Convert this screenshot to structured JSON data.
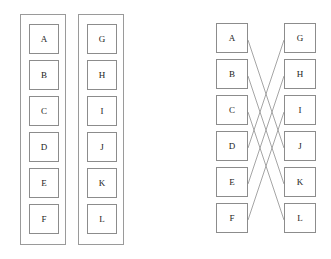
{
  "figure": {
    "title": "",
    "background_color": "#ffffff",
    "box_border_color": "#8c8c8c",
    "panel_border_color": "#9a9a9a",
    "edge_color": "#9b9b9b",
    "text_color": "#222222"
  },
  "left_figure": {
    "name": "two-separate-sets",
    "panels": [
      {
        "name": "set-left",
        "x": 20,
        "y": 14,
        "width": 46,
        "height": 231,
        "items": [
          {
            "label": "A",
            "x": 8,
            "y": 9,
            "w": 30,
            "h": 30
          },
          {
            "label": "B",
            "x": 8,
            "y": 45,
            "w": 30,
            "h": 30
          },
          {
            "label": "C",
            "x": 8,
            "y": 81,
            "w": 30,
            "h": 30
          },
          {
            "label": "D",
            "x": 8,
            "y": 117,
            "w": 30,
            "h": 30
          },
          {
            "label": "E",
            "x": 8,
            "y": 153,
            "w": 30,
            "h": 30
          },
          {
            "label": "F",
            "x": 8,
            "y": 189,
            "w": 30,
            "h": 30
          }
        ]
      },
      {
        "name": "set-right",
        "x": 78,
        "y": 14,
        "width": 46,
        "height": 231,
        "items": [
          {
            "label": "G",
            "x": 8,
            "y": 9,
            "w": 30,
            "h": 30
          },
          {
            "label": "H",
            "x": 8,
            "y": 45,
            "w": 30,
            "h": 30
          },
          {
            "label": "I",
            "x": 8,
            "y": 81,
            "w": 30,
            "h": 30
          },
          {
            "label": "J",
            "x": 8,
            "y": 117,
            "w": 30,
            "h": 30
          },
          {
            "label": "K",
            "x": 8,
            "y": 153,
            "w": 30,
            "h": 30
          },
          {
            "label": "L",
            "x": 8,
            "y": 189,
            "w": 30,
            "h": 30
          }
        ]
      }
    ]
  },
  "right_figure": {
    "name": "bipartite-mapping",
    "left_column": [
      {
        "label": "A",
        "x": 216,
        "y": 23,
        "w": 32,
        "h": 30
      },
      {
        "label": "B",
        "x": 216,
        "y": 59,
        "w": 32,
        "h": 30
      },
      {
        "label": "C",
        "x": 216,
        "y": 95,
        "w": 32,
        "h": 30
      },
      {
        "label": "D",
        "x": 216,
        "y": 131,
        "w": 32,
        "h": 30
      },
      {
        "label": "E",
        "x": 216,
        "y": 167,
        "w": 32,
        "h": 30
      },
      {
        "label": "F",
        "x": 216,
        "y": 203,
        "w": 32,
        "h": 30
      }
    ],
    "right_column": [
      {
        "label": "G",
        "x": 284,
        "y": 23,
        "w": 32,
        "h": 30
      },
      {
        "label": "H",
        "x": 284,
        "y": 59,
        "w": 32,
        "h": 30
      },
      {
        "label": "I",
        "x": 284,
        "y": 95,
        "w": 32,
        "h": 30
      },
      {
        "label": "J",
        "x": 284,
        "y": 131,
        "w": 32,
        "h": 30
      },
      {
        "label": "K",
        "x": 284,
        "y": 167,
        "w": 32,
        "h": 30
      },
      {
        "label": "L",
        "x": 284,
        "y": 203,
        "w": 32,
        "h": 30
      }
    ],
    "edges": [
      {
        "from": "A",
        "to": "J",
        "x1": 248,
        "y1": 40,
        "x2": 284,
        "y2": 148
      },
      {
        "from": "B",
        "to": "K",
        "x1": 248,
        "y1": 76,
        "x2": 284,
        "y2": 184
      },
      {
        "from": "C",
        "to": "L",
        "x1": 248,
        "y1": 112,
        "x2": 284,
        "y2": 220
      },
      {
        "from": "D",
        "to": "G",
        "x1": 248,
        "y1": 148,
        "x2": 284,
        "y2": 40
      },
      {
        "from": "E",
        "to": "H",
        "x1": 248,
        "y1": 184,
        "x2": 284,
        "y2": 76
      },
      {
        "from": "F",
        "to": "I",
        "x1": 248,
        "y1": 220,
        "x2": 284,
        "y2": 112
      }
    ]
  }
}
